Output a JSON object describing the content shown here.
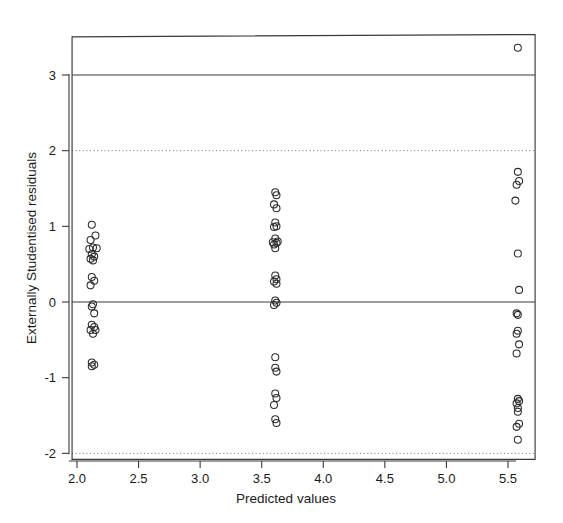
{
  "chart_data": {
    "type": "scatter",
    "title": "",
    "xlabel": "Predicted values",
    "ylabel": "Externally Studentised residuals",
    "xlim": [
      1.96,
      5.72
    ],
    "ylim": [
      -2.08,
      3.52
    ],
    "xticks": [
      2.0,
      2.5,
      3.0,
      3.5,
      4.0,
      4.5,
      5.0,
      5.5
    ],
    "xticklabels": [
      "2.0",
      "2.5",
      "3.0",
      "3.5",
      "4.0",
      "4.5",
      "5.0",
      "5.5"
    ],
    "yticks": [
      -2,
      -1,
      0,
      1,
      2,
      3
    ],
    "yticklabels": [
      "-2",
      "-1",
      "0",
      "1",
      "2",
      "3"
    ],
    "grid": false,
    "legend": null,
    "marker": "open-circle",
    "marker_color": "#2b2b2b",
    "reference_lines": [
      {
        "y": 3,
        "style": "solid",
        "label": ""
      },
      {
        "y": 2,
        "style": "dotted",
        "label": ""
      },
      {
        "y": 0,
        "style": "solid",
        "label": ""
      },
      {
        "y": -2,
        "style": "dotted",
        "label": ""
      }
    ],
    "point_count": 74,
    "clusters": [
      {
        "x_center": 2.13,
        "n": 24
      },
      {
        "x_center": 3.61,
        "n": 28
      },
      {
        "x_center": 5.58,
        "n": 22
      }
    ],
    "points": [
      {
        "x": 2.12,
        "y": 1.02
      },
      {
        "x": 2.15,
        "y": 0.88
      },
      {
        "x": 2.11,
        "y": 0.82
      },
      {
        "x": 2.13,
        "y": 0.72
      },
      {
        "x": 2.16,
        "y": 0.71
      },
      {
        "x": 2.1,
        "y": 0.7
      },
      {
        "x": 2.12,
        "y": 0.63
      },
      {
        "x": 2.14,
        "y": 0.6
      },
      {
        "x": 2.11,
        "y": 0.57
      },
      {
        "x": 2.13,
        "y": 0.55
      },
      {
        "x": 2.12,
        "y": 0.33
      },
      {
        "x": 2.14,
        "y": 0.28
      },
      {
        "x": 2.11,
        "y": 0.22
      },
      {
        "x": 2.13,
        "y": -0.03
      },
      {
        "x": 2.12,
        "y": -0.06
      },
      {
        "x": 2.14,
        "y": -0.15
      },
      {
        "x": 2.12,
        "y": -0.3
      },
      {
        "x": 2.14,
        "y": -0.33
      },
      {
        "x": 2.11,
        "y": -0.37
      },
      {
        "x": 2.15,
        "y": -0.37
      },
      {
        "x": 2.13,
        "y": -0.42
      },
      {
        "x": 2.12,
        "y": -0.8
      },
      {
        "x": 2.14,
        "y": -0.83
      },
      {
        "x": 2.12,
        "y": -0.85
      },
      {
        "x": 3.61,
        "y": 1.45
      },
      {
        "x": 3.62,
        "y": 1.41
      },
      {
        "x": 3.6,
        "y": 1.29
      },
      {
        "x": 3.62,
        "y": 1.24
      },
      {
        "x": 3.61,
        "y": 1.05
      },
      {
        "x": 3.62,
        "y": 1.0
      },
      {
        "x": 3.6,
        "y": 0.99
      },
      {
        "x": 3.61,
        "y": 0.84
      },
      {
        "x": 3.63,
        "y": 0.8
      },
      {
        "x": 3.59,
        "y": 0.79
      },
      {
        "x": 3.62,
        "y": 0.78
      },
      {
        "x": 3.6,
        "y": 0.76
      },
      {
        "x": 3.61,
        "y": 0.71
      },
      {
        "x": 3.61,
        "y": 0.35
      },
      {
        "x": 3.62,
        "y": 0.3
      },
      {
        "x": 3.6,
        "y": 0.27
      },
      {
        "x": 3.62,
        "y": 0.24
      },
      {
        "x": 3.61,
        "y": 0.02
      },
      {
        "x": 3.62,
        "y": -0.01
      },
      {
        "x": 3.6,
        "y": -0.04
      },
      {
        "x": 3.61,
        "y": -0.73
      },
      {
        "x": 3.61,
        "y": -0.87
      },
      {
        "x": 3.62,
        "y": -0.92
      },
      {
        "x": 3.61,
        "y": -1.21
      },
      {
        "x": 3.62,
        "y": -1.27
      },
      {
        "x": 3.6,
        "y": -1.36
      },
      {
        "x": 3.61,
        "y": -1.55
      },
      {
        "x": 3.62,
        "y": -1.6
      },
      {
        "x": 5.58,
        "y": 3.36
      },
      {
        "x": 5.58,
        "y": 1.72
      },
      {
        "x": 5.59,
        "y": 1.6
      },
      {
        "x": 5.57,
        "y": 1.55
      },
      {
        "x": 5.56,
        "y": 1.34
      },
      {
        "x": 5.58,
        "y": 0.64
      },
      {
        "x": 5.59,
        "y": 0.16
      },
      {
        "x": 5.57,
        "y": -0.15
      },
      {
        "x": 5.58,
        "y": -0.17
      },
      {
        "x": 5.58,
        "y": -0.38
      },
      {
        "x": 5.57,
        "y": -0.42
      },
      {
        "x": 5.59,
        "y": -0.56
      },
      {
        "x": 5.57,
        "y": -0.68
      },
      {
        "x": 5.58,
        "y": -1.28
      },
      {
        "x": 5.59,
        "y": -1.31
      },
      {
        "x": 5.57,
        "y": -1.34
      },
      {
        "x": 5.58,
        "y": -1.4
      },
      {
        "x": 5.58,
        "y": -1.45
      },
      {
        "x": 5.59,
        "y": -1.61
      },
      {
        "x": 5.57,
        "y": -1.65
      },
      {
        "x": 5.58,
        "y": -1.82
      }
    ]
  }
}
